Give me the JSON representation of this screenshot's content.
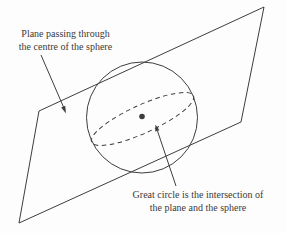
{
  "colors": {
    "line": "#3d3d3d",
    "text": "#3a3a3a",
    "background": "#fdfdfd"
  },
  "labels": {
    "plane": {
      "line1": "Plane passing through",
      "line2": "the centre of the sphere"
    },
    "great_circle": {
      "line1": "Great circle is the intersection of",
      "line2": "the plane and the sphere"
    }
  },
  "diagram": {
    "type": "geometry-illustration",
    "elements": [
      "plane-parallelogram",
      "sphere-outline-circle",
      "great-circle-dashed-ellipse",
      "sphere-centre-dot",
      "plane-annotation-arrow",
      "great-circle-annotation-arrow"
    ]
  }
}
